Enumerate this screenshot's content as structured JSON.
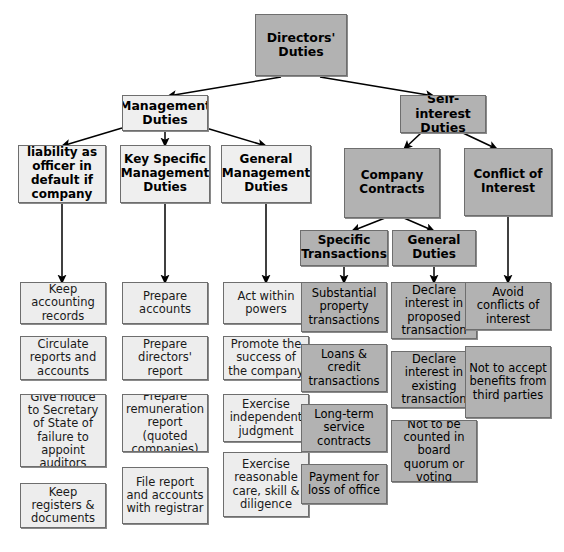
{
  "diagram": {
    "title_node": {
      "label": "Directors' Duties",
      "style": "dark"
    },
    "level2": [
      {
        "label": "Management Duties",
        "style": "light"
      },
      {
        "label": "Self-interest Duties",
        "style": "dark"
      }
    ],
    "level3": [
      {
        "label": "Criminal liability as officer in default if company fails",
        "style": "light"
      },
      {
        "label": "Key Specific Management Duties",
        "style": "light"
      },
      {
        "label": "General Management Duties",
        "style": "light"
      },
      {
        "label": "Company Contracts",
        "style": "dark"
      },
      {
        "label": "Conflict of Interest",
        "style": "dark"
      }
    ],
    "level4": [
      {
        "label": "Specific Transactions",
        "style": "dark"
      },
      {
        "label": "General Duties",
        "style": "dark"
      }
    ],
    "columns": [
      {
        "name": "criminal-liability",
        "style": "light",
        "items": [
          "Keep accounting records",
          "Circulate reports and accounts",
          "Give notice to Secretary of State of failure to appoint auditors",
          "Keep registers & documents"
        ]
      },
      {
        "name": "key-specific-management-duties",
        "style": "light",
        "items": [
          "Prepare accounts",
          "Prepare directors' report",
          "Prepare remuneration report (quoted companies)",
          "File report and accounts with registrar"
        ]
      },
      {
        "name": "general-management-duties",
        "style": "light",
        "items": [
          "Act within powers",
          "Promote the success of the company",
          "Exercise independent judgment",
          "Exercise reasonable care, skill & diligence"
        ]
      },
      {
        "name": "specific-transactions",
        "style": "dark",
        "items": [
          "Substantial property transactions",
          "Loans & credit transactions",
          "Long-term service contracts",
          "Payment for loss of office"
        ]
      },
      {
        "name": "general-duties",
        "style": "dark",
        "items": [
          "Declare interest in proposed transaction",
          "Declare interest in existing transaction",
          "Not to be counted in board quorum or voting"
        ]
      },
      {
        "name": "conflict-of-interest",
        "style": "dark",
        "items": [
          "Avoid conflicts of interest",
          "Not to accept benefits from third parties"
        ]
      }
    ],
    "colors": {
      "dark_fill": "#b2b2b2",
      "light_fill": "#efefef",
      "leaf_light_fill": "#ededed",
      "border": "#6e6e6e",
      "connector": "#000000",
      "background": "#ffffff"
    }
  }
}
